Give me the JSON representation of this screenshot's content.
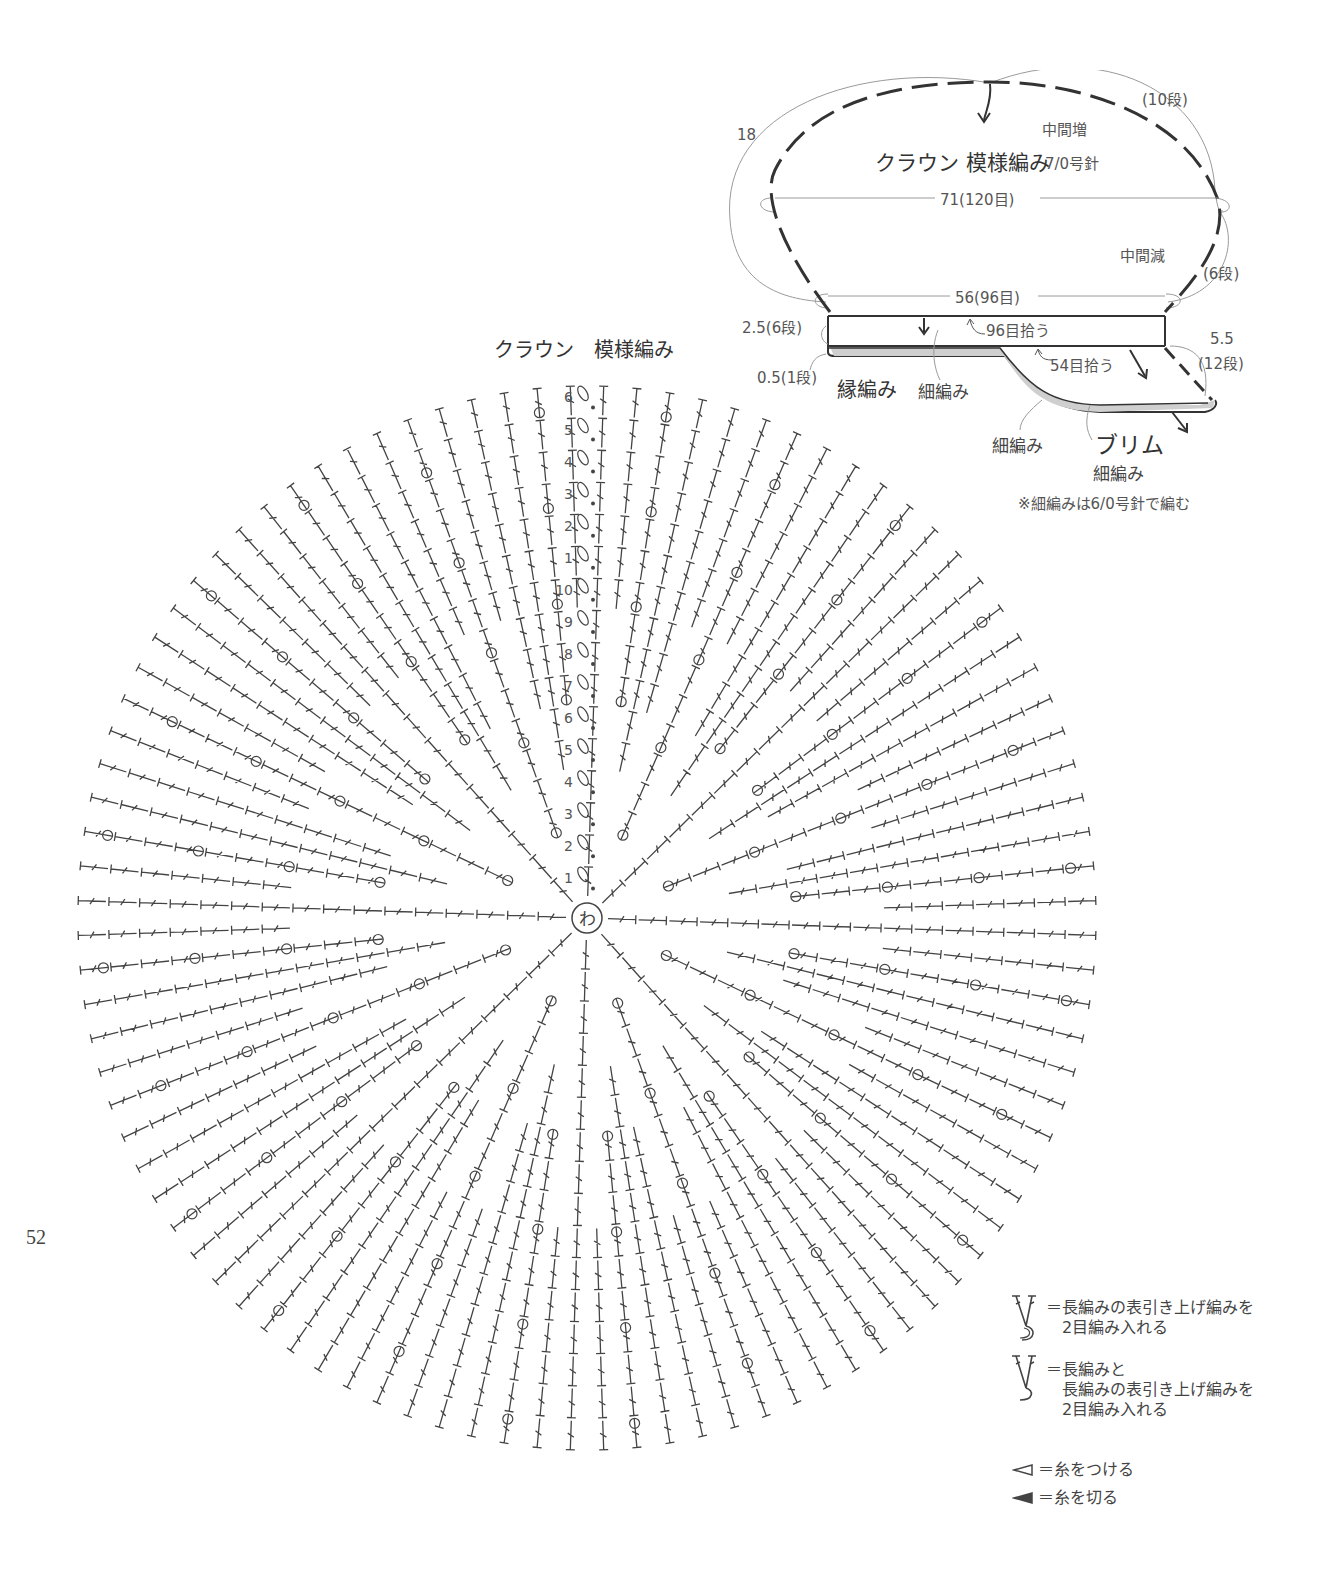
{
  "page_number": "52",
  "schematic": {
    "crown_title": "クラウン 模様編み",
    "crown_needle": "7/0号針",
    "increase_note": "中間増",
    "decrease_note": "中間減",
    "height_label": "18",
    "rows_top": "(10段)",
    "rows_mid": "(6段)",
    "width_max": "71(120目)",
    "width_base": "56(96目)",
    "band_height": "2.5(6段)",
    "edge_height": "0.5(1段)",
    "pickup_band": "96目拾う",
    "pickup_brim": "54目拾う",
    "brim_depth": "5.5",
    "brim_rows": "(12段)",
    "edging_label": "縁編み",
    "band_stitch": "細編み",
    "brim_edge_stitch": "細編み",
    "brim_title": "ブリム",
    "brim_stitch": "細編み",
    "note": "※細編みは6/0号針で編む"
  },
  "chart": {
    "title": "クラウン　模様編み",
    "center_label": "わ",
    "rows_lower": [
      "1",
      "2",
      "3",
      "4",
      "5",
      "6",
      "7",
      "8",
      "9",
      "10"
    ],
    "rows_upper": [
      "1",
      "2",
      "3",
      "4",
      "5",
      "6"
    ],
    "total_rows": 16,
    "center": [
      587,
      918
    ],
    "spokes": 96,
    "radius_x": 512,
    "radius_y": 535
  },
  "legend": [
    {
      "icon": "front-post-dc-2-in-1-icon",
      "text_lines": [
        "＝長編みの表引き上げ編みを",
        "2目編み入れる"
      ]
    },
    {
      "icon": "dc-and-front-post-dc-2-in-1-icon",
      "text_lines": [
        "＝長編みと",
        "長編みの表引き上げ編みを",
        "2目編み入れる"
      ]
    },
    {
      "icon": "join-yarn-icon",
      "text_lines": [
        "＝糸をつける"
      ]
    },
    {
      "icon": "cut-yarn-icon",
      "text_lines": [
        "＝糸を切る"
      ]
    }
  ],
  "colors": {
    "ink": "#444444",
    "thin_line": "#9a9a9a",
    "edge_fill": "#cfcfcf"
  }
}
